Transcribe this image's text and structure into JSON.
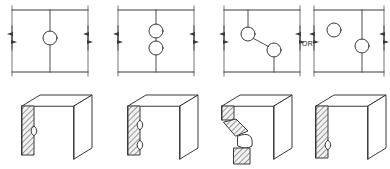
{
  "figure": {
    "title": "",
    "or_label": "OR",
    "line_color": "#3a3a3a",
    "hatch_color": "#2b2b2b",
    "face_fill": "#f2f2f2",
    "background": "#ffffff"
  },
  "top_row": {
    "name": "schematic-plan-views",
    "panels": [
      {
        "id": "panel-1",
        "label": "",
        "frame": {
          "x": 12,
          "y": 10,
          "width": 76,
          "height": 62
        },
        "center_line": {
          "x": 50,
          "top": 10,
          "bottom": 72
        },
        "circles": [
          {
            "cx": 50,
            "cy": 38,
            "r": 7
          }
        ],
        "dimension_arrows": [
          "left",
          "right"
        ],
        "circle_count": 1,
        "arrangement": "single-centered"
      },
      {
        "id": "panel-2",
        "label": "",
        "frame": {
          "x": 118,
          "y": 10,
          "width": 76,
          "height": 62
        },
        "center_line": {
          "x": 156,
          "top": 10,
          "bottom": 72
        },
        "circles": [
          {
            "cx": 156,
            "cy": 31,
            "r": 7
          },
          {
            "cx": 156,
            "cy": 48,
            "r": 7
          }
        ],
        "dimension_arrows": [
          "left",
          "right"
        ],
        "circle_count": 2,
        "arrangement": "two-stacked-centered"
      },
      {
        "id": "panel-3",
        "label": "",
        "frame": {
          "x": 224,
          "y": 10,
          "width": 76,
          "height": 62
        },
        "center_line": {
          "x": 248,
          "top": 10,
          "bottom": 30
        },
        "circles": [
          {
            "cx": 248,
            "cy": 34,
            "r": 7
          },
          {
            "cx": 274,
            "cy": 50,
            "r": 7
          }
        ],
        "connector": {
          "x1": 253,
          "y1": 39,
          "x2": 269,
          "y2": 46
        },
        "stub_lines": [
          {
            "x1": 248,
            "y1": 10,
            "x2": 248,
            "y2": 27
          },
          {
            "x1": 274,
            "y1": 57,
            "x2": 274,
            "y2": 72
          }
        ],
        "dimension_arrows": [
          "left",
          "right"
        ],
        "circle_count": 2,
        "arrangement": "two-staggered-diagonal"
      },
      {
        "id": "panel-4",
        "label": "",
        "frame": {
          "x": 314,
          "y": 10,
          "width": 70,
          "height": 62
        },
        "center_line": {
          "x": 362,
          "top": 10,
          "bottom": 72
        },
        "circles": [
          {
            "cx": 334,
            "cy": 30,
            "r": 7
          },
          {
            "cx": 362,
            "cy": 46,
            "r": 7
          }
        ],
        "dimension_arrows": [
          "left",
          "right"
        ],
        "circle_count": 2,
        "arrangement": "one-offset-one-centered"
      }
    ]
  },
  "bottom_row": {
    "name": "isometric-pictorial-views",
    "panels": [
      {
        "id": "pictorial-1",
        "label": "",
        "notch_count": 1,
        "notch_style": "single-round-notch",
        "description": "plate edge with one semicircular notch"
      },
      {
        "id": "pictorial-2",
        "label": "",
        "notch_count": 2,
        "notch_style": "two-round-notches",
        "description": "plate edge with two semicircular notches"
      },
      {
        "id": "pictorial-3",
        "label": "",
        "notch_count": 2,
        "notch_style": "staggered-offset-notches",
        "description": "plate edge with staggered diagonal offset notches"
      },
      {
        "id": "pictorial-4",
        "label": "",
        "notch_count": 1,
        "notch_style": "low-round-notch",
        "description": "plate edge with one notch near the lower end"
      }
    ]
  }
}
